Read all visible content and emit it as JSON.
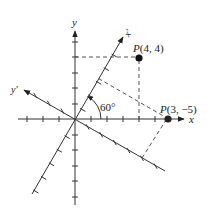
{
  "diagram": {
    "type": "rotated-coordinate-axes",
    "origin_px": [
      75,
      119
    ],
    "unit_px": 15.7,
    "rotation_deg": 60,
    "axes": {
      "x": {
        "label": "x"
      },
      "y": {
        "label": "y"
      },
      "x_prime": {
        "label": "x",
        "prime": "′"
      },
      "y_prime": {
        "label": "y",
        "prime": "′"
      }
    },
    "angle_label": "60°",
    "points": [
      {
        "name": "P",
        "coords_text": "(4, 4)",
        "system": "xy",
        "x": 4,
        "y": 4
      },
      {
        "name": "P",
        "coords_text": "(3, −5)",
        "system": "x'y'",
        "x": 3,
        "y": -5
      }
    ],
    "colors": {
      "line": "#333333",
      "dot": "#111111",
      "background": "#ffffff"
    }
  }
}
